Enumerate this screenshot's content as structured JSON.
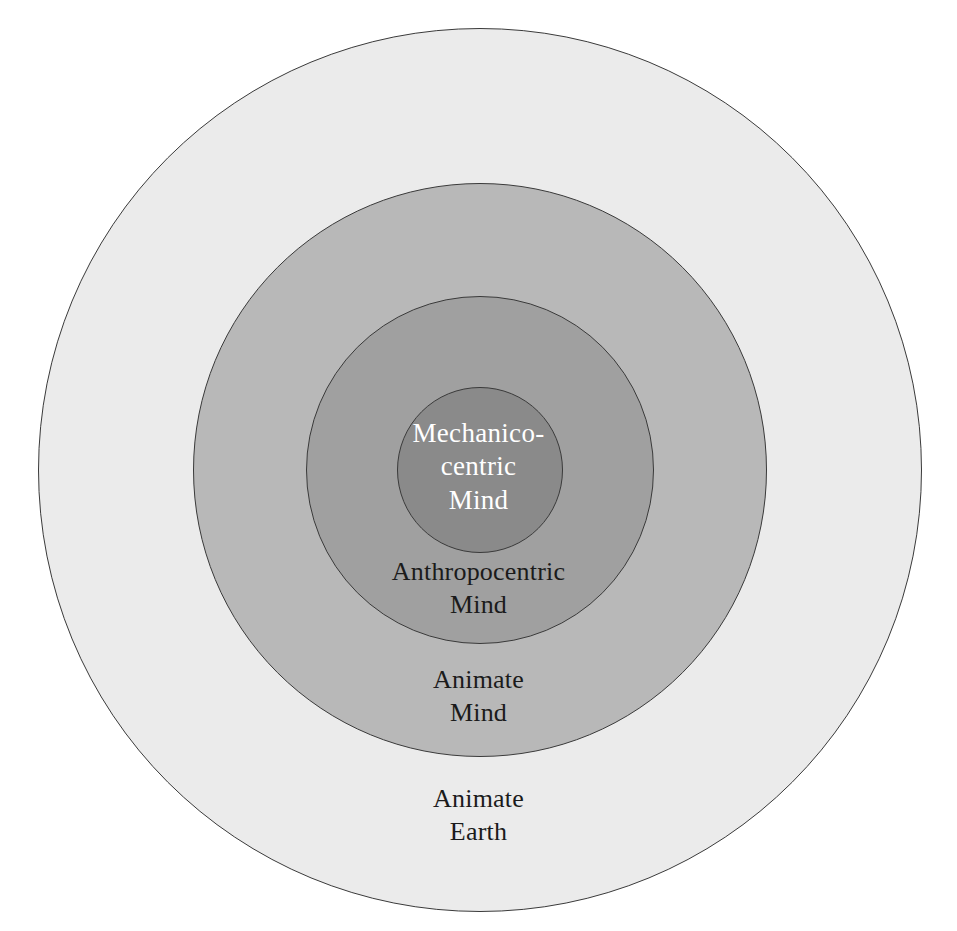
{
  "diagram": {
    "type": "concentric-circles",
    "title": "",
    "background_color": "#ffffff",
    "center": {
      "x": 480,
      "y": 470
    },
    "levels": [
      {
        "id": "animate-earth",
        "label": "Animate\nEarth",
        "label_line1": "Animate",
        "label_line2": "Earth",
        "radius": 442,
        "fill": "#ebebeb",
        "stroke": "#3a3a3a",
        "text_color": "#1b1b1b",
        "order": 1
      },
      {
        "id": "animate-mind",
        "label": "Animate\nMind",
        "label_line1": "Animate",
        "label_line2": "Mind",
        "radius": 287,
        "fill": "#b8b8b8",
        "stroke": "#3a3a3a",
        "text_color": "#1b1b1b",
        "order": 2
      },
      {
        "id": "anthropocentric-mind",
        "label": "Anthropocentric\nMind",
        "label_line1": "Anthropocentric",
        "label_line2": "Mind",
        "radius": 174,
        "fill": "#a0a0a0",
        "stroke": "#3a3a3a",
        "text_color": "#1b1b1b",
        "order": 3
      },
      {
        "id": "mechanico-centric-mind",
        "label": "Mechanico-\ncentric\nMind",
        "label_line1": "Mechanico-",
        "label_line2": "centric",
        "label_line3": "Mind",
        "radius": 83,
        "fill": "#8a8a8a",
        "stroke": "#3a3a3a",
        "text_color": "#ffffff",
        "order": 4
      }
    ]
  }
}
